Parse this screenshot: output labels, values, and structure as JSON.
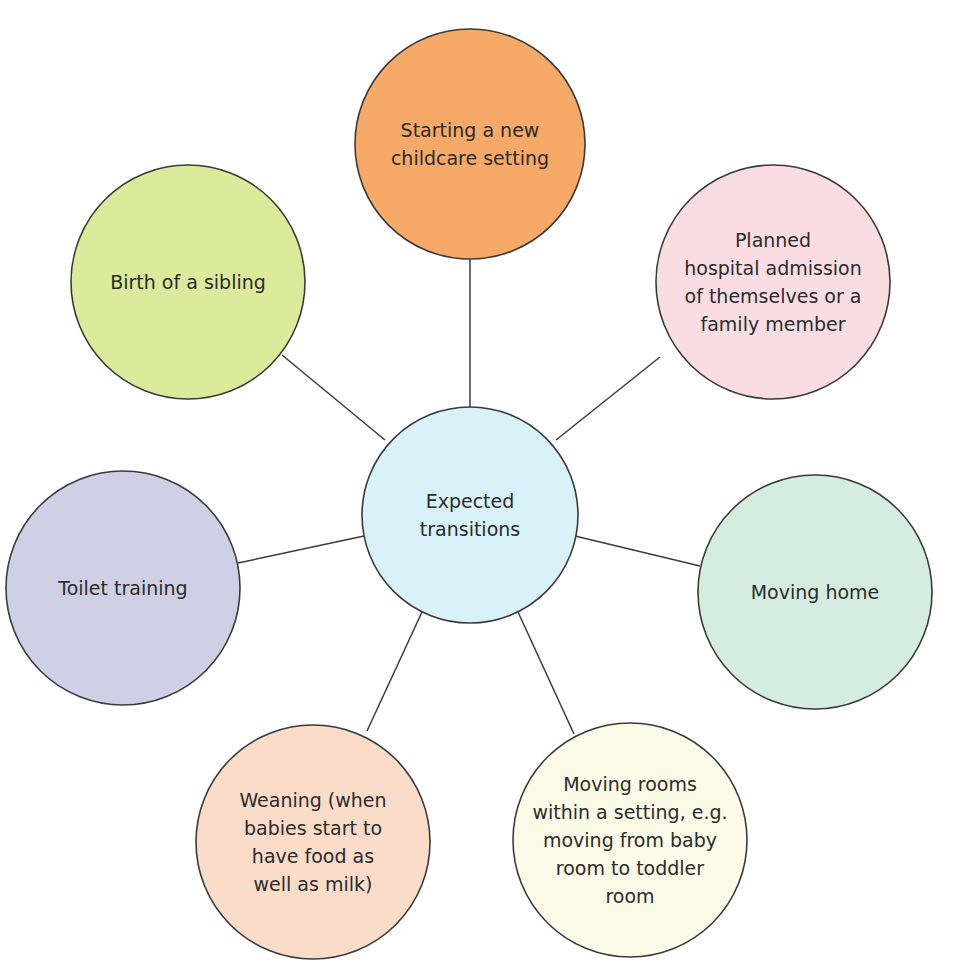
{
  "diagram": {
    "type": "spider-diagram",
    "center": {
      "label": "Expected\ntransitions",
      "cx": 470,
      "cy": 515,
      "r": 108,
      "color": "#d9f1f8"
    },
    "nodes": [
      {
        "id": "starting-childcare",
        "label": "Starting a new\nchildcare setting",
        "cx": 470,
        "cy": 144,
        "r": 115,
        "color": "#f7aa68"
      },
      {
        "id": "hospital-admission",
        "label": "Planned\nhospital admission\nof themselves or a\nfamily member",
        "cx": 773,
        "cy": 282,
        "r": 117,
        "color": "#f9dde3"
      },
      {
        "id": "moving-home",
        "label": "Moving home",
        "cx": 815,
        "cy": 592,
        "r": 117,
        "color": "#d5ede0"
      },
      {
        "id": "moving-rooms",
        "label": "Moving rooms\nwithin a setting, e.g.\nmoving from baby\nroom to toddler\nroom",
        "cx": 630,
        "cy": 840,
        "r": 117,
        "color": "#fcfbe7"
      },
      {
        "id": "weaning",
        "label": "Weaning (when\nbabies start to\nhave food as\nwell as milk)",
        "cx": 313,
        "cy": 842,
        "r": 117,
        "color": "#fbdcc9"
      },
      {
        "id": "toilet-training",
        "label": "Toilet training",
        "cx": 123,
        "cy": 588,
        "r": 117,
        "color": "#cfd0e6"
      },
      {
        "id": "birth-sibling",
        "label": "Birth of a sibling",
        "cx": 188,
        "cy": 282,
        "r": 117,
        "color": "#dcea9c"
      }
    ],
    "connectors": [
      {
        "to": "starting-childcare",
        "x1": 470,
        "y1": 407,
        "x2": 470,
        "y2": 259
      },
      {
        "to": "hospital-admission",
        "x1": 556,
        "y1": 440,
        "x2": 660,
        "y2": 357
      },
      {
        "to": "moving-home",
        "x1": 575,
        "y1": 536,
        "x2": 700,
        "y2": 566
      },
      {
        "to": "moving-rooms",
        "x1": 518,
        "y1": 612,
        "x2": 574,
        "y2": 734
      },
      {
        "to": "weaning",
        "x1": 422,
        "y1": 612,
        "x2": 367,
        "y2": 731
      },
      {
        "to": "toilet-training",
        "x1": 364,
        "y1": 536,
        "x2": 238,
        "y2": 563
      },
      {
        "to": "birth-sibling",
        "x1": 385,
        "y1": 440,
        "x2": 282,
        "y2": 355
      }
    ],
    "stroke_color": "#3a3a3a",
    "text_color": "#2b2b2b"
  }
}
